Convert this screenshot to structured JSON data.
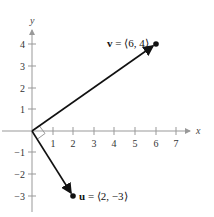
{
  "diagram": {
    "type": "vector-plot",
    "axes": {
      "x_label": "x",
      "y_label": "y",
      "x_ticks": [
        "1",
        "2",
        "3",
        "4",
        "5",
        "6",
        "7"
      ],
      "y_ticks_pos": [
        "1",
        "2",
        "3",
        "4"
      ],
      "y_ticks_neg": [
        "−1",
        "−2",
        "−3"
      ]
    },
    "vectors": [
      {
        "name": "v",
        "label_rest": " = ⟨6, 4⟩",
        "x": 6,
        "y": 4
      },
      {
        "name": "u",
        "label_rest": " = ⟨2, −3⟩",
        "x": 2,
        "y": -3
      }
    ],
    "annotation": "right-angle marker at origin",
    "colors": {
      "axis": "#999999",
      "vector": "#111111"
    }
  }
}
